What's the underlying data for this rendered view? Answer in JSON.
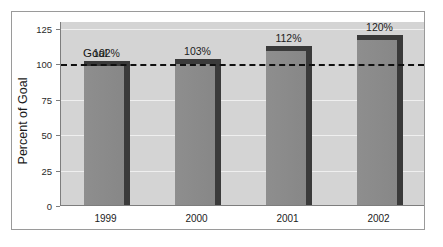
{
  "chart_data": {
    "type": "bar",
    "title": "",
    "xlabel": "",
    "ylabel": "Percent of Goal",
    "categories": [
      "1999",
      "2000",
      "2001",
      "2002"
    ],
    "values": [
      102,
      103,
      112,
      120
    ],
    "data_labels": [
      "102%",
      "103%",
      "112%",
      "120%"
    ],
    "ylim": [
      0,
      130
    ],
    "yticks": [
      0,
      25,
      50,
      75,
      100,
      125
    ],
    "ytick_labels": [
      "0",
      "25",
      "50",
      "75",
      "100",
      "125"
    ],
    "gridlines": [
      25,
      50,
      75,
      125
    ],
    "grid": true,
    "legend": "none",
    "reference_line": {
      "label": "Goal",
      "value": 100,
      "style": "dashed",
      "color": "#101010"
    },
    "colors": {
      "bar_fill": "#8a8a8a",
      "bar_shadow": "#3a3a3a",
      "plot_background": "#d4d4d4",
      "gridline": "#efefef",
      "axis": "#7d7d7d",
      "frame": "#9a9a9a",
      "text": "#1a1a1a"
    }
  }
}
